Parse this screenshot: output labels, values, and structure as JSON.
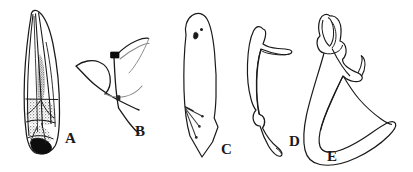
{
  "figure": {
    "kind": "scientific-line-drawing-plate",
    "background_color": "#ffffff",
    "ink_color": "#1a1a1a",
    "shade_gray": "#8f8f8f",
    "shade_dark": "#111111",
    "width_px": 413,
    "height_px": 172,
    "panels": [
      {
        "id": "A",
        "label": "A",
        "subject": "forewing-tegmen-with-venation-and-dark-basal-shading",
        "label_x": 65,
        "label_y": 131
      },
      {
        "id": "B",
        "label": "B",
        "subject": "slender-branched-sclerite-with-black-node",
        "label_x": 135,
        "label_y": 124
      },
      {
        "id": "C",
        "label": "C",
        "subject": "blade-shaped-plate-with-three-setae",
        "label_x": 221,
        "label_y": 142
      },
      {
        "id": "D",
        "label": "D",
        "subject": "curved-sickle-shaped-sclerite",
        "label_x": 289,
        "label_y": 134
      },
      {
        "id": "E",
        "label": "E",
        "subject": "hook-shaped-sclerite-with-coiled-apex",
        "label_x": 327,
        "label_y": 149
      }
    ]
  }
}
